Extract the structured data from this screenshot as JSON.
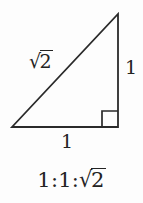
{
  "diagram": {
    "kind": "right-triangle-ratio",
    "caption": "1:1:√2",
    "caption_parts": {
      "prefix": "1:1:",
      "radix": "√",
      "radicand": "2"
    },
    "labels": {
      "hypotenuse": {
        "text": "√2",
        "radix": "√",
        "radicand": "2"
      },
      "leg_vertical": {
        "text": "1"
      },
      "leg_base": {
        "text": "1"
      }
    },
    "right_angle_marker": {
      "present": true,
      "name": "right-angle-square"
    },
    "geometry": {
      "apex": [
        118,
        14
      ],
      "bottom_right": [
        118,
        127
      ],
      "bottom_left": [
        12,
        127
      ],
      "square_size": 16
    },
    "colors": {
      "stroke": "#2a2a2a",
      "text": "#232323",
      "background": "#fdfdfd"
    },
    "stroke_width": 1.8
  }
}
